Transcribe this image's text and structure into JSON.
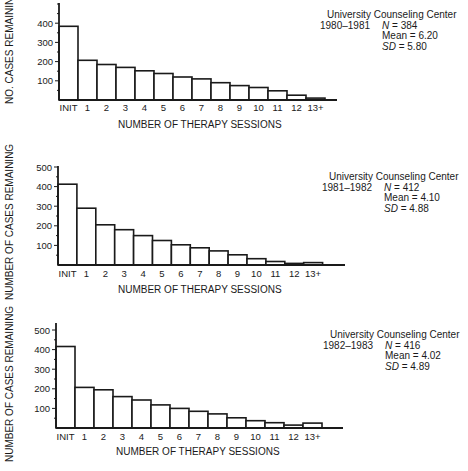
{
  "chart_data": [
    {
      "type": "bar",
      "title": "University Counseling Center 1980-1981",
      "org": "University Counseling Center",
      "years": "1980–1981",
      "stats": {
        "n_label": "N",
        "n": "384",
        "mean_label": "Mean",
        "mean": "6.20",
        "sd_label": "SD",
        "sd": "5.80"
      },
      "xlabel": "NUMBER OF THERAPY SESSIONS",
      "ylabel": "NO. CASES REMAINING",
      "categories": [
        "INIT",
        "1",
        "2",
        "3",
        "4",
        "5",
        "6",
        "7",
        "8",
        "9",
        "10",
        "11",
        "12",
        "13+"
      ],
      "values": [
        384,
        207,
        185,
        170,
        152,
        138,
        120,
        110,
        90,
        75,
        65,
        48,
        25,
        10
      ],
      "yticks": [
        100,
        200,
        300,
        400
      ],
      "ylim": [
        0,
        500
      ],
      "grid": false
    },
    {
      "type": "bar",
      "title": "University Counseling Center 1981-1982",
      "org": "University Counseling Center",
      "years": "1981–1982",
      "stats": {
        "n_label": "N",
        "n": "412",
        "mean_label": "Mean",
        "mean": "4.10",
        "sd_label": "SD",
        "sd": "4.88"
      },
      "xlabel": "NUMBER OF THERAPY SESSIONS",
      "ylabel": "NUMBER OF CASES REMAINING",
      "categories": [
        "INIT",
        "1",
        "2",
        "3",
        "4",
        "5",
        "6",
        "7",
        "8",
        "9",
        "10",
        "11",
        "12",
        "13+"
      ],
      "values": [
        412,
        290,
        205,
        180,
        150,
        125,
        103,
        88,
        72,
        52,
        32,
        18,
        8,
        12
      ],
      "yticks": [
        100,
        200,
        300,
        400,
        500
      ],
      "ylim": [
        0,
        500
      ],
      "grid": false
    },
    {
      "type": "bar",
      "title": "University Counseling Center 1982-1983",
      "org": "University Counseling Center",
      "years": "1982–1983",
      "stats": {
        "n_label": "N",
        "n": "416",
        "mean_label": "Mean",
        "mean": "4.02",
        "sd_label": "SD",
        "sd": "4.89"
      },
      "xlabel": "NUMBER OF THERAPY SESSIONS",
      "ylabel": "NUMBER OF CASES REMAINING",
      "categories": [
        "INIT",
        "1",
        "2",
        "3",
        "4",
        "5",
        "6",
        "7",
        "8",
        "9",
        "10",
        "11",
        "12",
        "13+"
      ],
      "values": [
        416,
        207,
        195,
        160,
        143,
        118,
        100,
        85,
        72,
        52,
        37,
        27,
        15,
        25
      ],
      "yticks": [
        100,
        200,
        300,
        400,
        500
      ],
      "ylim": [
        0,
        500
      ],
      "grid": false
    }
  ],
  "layout": [
    {
      "top": 0,
      "axisX": 59,
      "baseY": 100,
      "axisTop": 3,
      "pxPer100": 19.2,
      "barW": 19.0,
      "axisEnd": 337,
      "tickLabelY": 111,
      "xlabX": 118,
      "xlabY": 119,
      "ylabX": 4,
      "ylabY": 104,
      "annoX": 320,
      "annoY": 10
    },
    {
      "top": 0,
      "axisX": 58,
      "baseY": 265,
      "axisTop": 166,
      "pxPer100": 19.6,
      "barW": 18.9,
      "axisEnd": 345,
      "tickLabelY": 277,
      "xlabX": 118,
      "xlabY": 284,
      "ylabX": 4,
      "ylabY": 300,
      "annoX": 322,
      "annoY": 172
    },
    {
      "top": 0,
      "axisX": 56,
      "baseY": 428,
      "axisTop": 323,
      "pxPer100": 19.6,
      "barW": 19.0,
      "axisEnd": 343,
      "tickLabelY": 440,
      "xlabX": 116,
      "xlabY": 446,
      "ylabX": 4,
      "ylabY": 462,
      "annoX": 323,
      "annoY": 330
    }
  ]
}
